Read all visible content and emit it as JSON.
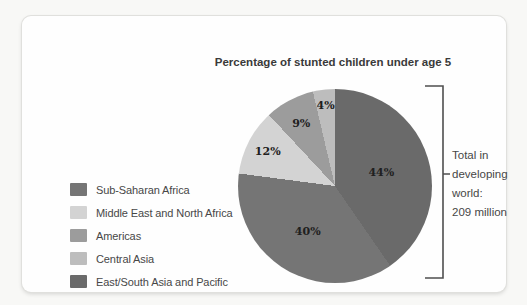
{
  "chart_data": {
    "type": "pie",
    "title": "Percentage of stunted children under age 5",
    "total_note": "Total in\ndeveloping\nworld:\n209 million",
    "total_value": "209 million",
    "unit": "%",
    "direction": "clockwise",
    "start_angle_deg": 0,
    "legend_position": "left",
    "slices": [
      {
        "label": "East/South Asia and Pacific",
        "value": 44,
        "display": "44%",
        "color": "#6a6a6a",
        "label_radius": 0.5
      },
      {
        "label": "Sub-Saharan Africa",
        "value": 40,
        "display": "40%",
        "color": "#757575",
        "label_radius": 0.54
      },
      {
        "label": "Middle East and North Africa",
        "value": 12,
        "display": "12%",
        "color": "#d3d3d3",
        "label_radius": 0.78
      },
      {
        "label": "Americas",
        "value": 9,
        "display": "9%",
        "color": "#9c9c9c",
        "label_radius": 0.74
      },
      {
        "label": "Central Asia",
        "value": 4,
        "display": "4%",
        "color": "#bdbdbd",
        "label_radius": 0.84
      }
    ],
    "legend_order": [
      "Sub-Saharan Africa",
      "Middle East and North Africa",
      "Americas",
      "Central Asia",
      "East/South Asia and Pacific"
    ]
  }
}
